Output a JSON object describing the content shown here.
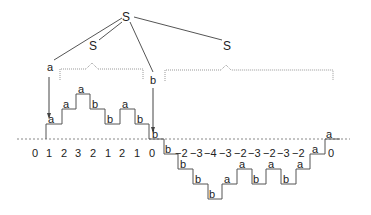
{
  "tree": {
    "root_label": "S",
    "inner_left_label": "S",
    "inner_right_label": "S",
    "leaf_a_label": "a",
    "leaf_b_label": "b"
  },
  "walk": {
    "upper_steps": [
      {
        "x": 47,
        "level": 1,
        "label": "a"
      },
      {
        "x": 62,
        "level": 2,
        "label": "a"
      },
      {
        "x": 77,
        "level": 3,
        "label": "a"
      },
      {
        "x": 91,
        "level": 2,
        "label": "b"
      },
      {
        "x": 106,
        "level": 1,
        "label": "b"
      },
      {
        "x": 121,
        "level": 2,
        "label": "a"
      },
      {
        "x": 136,
        "level": 1,
        "label": "b"
      },
      {
        "x": 151,
        "level": 0,
        "label": "b"
      }
    ],
    "lower_steps": [
      {
        "x": 164,
        "level": -1,
        "label": "b"
      },
      {
        "x": 179,
        "level": -2,
        "label": "b"
      },
      {
        "x": 194,
        "level": -3,
        "label": "b"
      },
      {
        "x": 208,
        "level": -4,
        "label": "b"
      },
      {
        "x": 223,
        "level": -3,
        "label": "a"
      },
      {
        "x": 238,
        "level": -2,
        "label": "a"
      },
      {
        "x": 252,
        "level": -3,
        "label": "b"
      },
      {
        "x": 267,
        "level": -2,
        "label": "a"
      },
      {
        "x": 282,
        "level": -3,
        "label": "b"
      },
      {
        "x": 296,
        "level": -2,
        "label": "a"
      },
      {
        "x": 311,
        "level": -1,
        "label": "a"
      },
      {
        "x": 325,
        "level": 0,
        "label": "a"
      }
    ],
    "height_labels_upper": [
      "0",
      "1",
      "2",
      "3",
      "2",
      "1",
      "2",
      "1",
      "0"
    ],
    "height_labels_lower": [
      "−2",
      "−3",
      "−4",
      "−3",
      "−2",
      "−3",
      "−2",
      "−3",
      "−2"
    ],
    "final_height_label": "0"
  },
  "colors": {
    "line": "#555555",
    "dotted": "#999999",
    "text": "#222222"
  }
}
